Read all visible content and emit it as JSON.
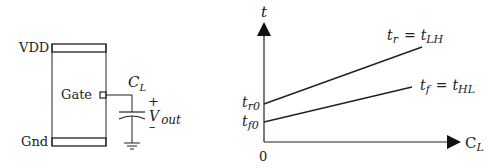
{
  "circuit": {
    "vdd_label": "VDD",
    "gnd_label": "Gnd",
    "gate_label": "Gate",
    "cap_label_main": "C",
    "cap_label_sub": "L",
    "plus_sign": "+",
    "minus_sign": "–",
    "vout_main": "V",
    "vout_sub": "out"
  },
  "chart": {
    "y_axis_label": "t",
    "x_axis_label_main": "C",
    "x_axis_label_sub": "L",
    "origin_label": "0",
    "tr0_main": "t",
    "tr0_sub": "r0",
    "tf0_main": "t",
    "tf0_sub": "f0",
    "rise_label": {
      "lhs_main": "t",
      "lhs_sub": "r",
      "eq": "=",
      "rhs_main": "t",
      "rhs_sub": "LH"
    },
    "fall_label": {
      "lhs_main": "t",
      "lhs_sub": "f",
      "eq": "=",
      "rhs_main": "t",
      "rhs_sub": "HL"
    }
  },
  "colors": {
    "line": "#222222",
    "background": "#ffffff"
  }
}
